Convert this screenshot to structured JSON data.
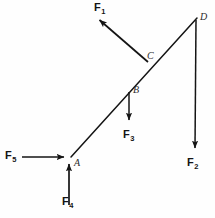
{
  "figure": {
    "type": "free-body-diagram",
    "background_color": "#fefefe",
    "stroke_color": "#141414",
    "points": [
      {
        "id": "A",
        "label": "A",
        "x": 71,
        "y": 157
      },
      {
        "id": "B",
        "label": "B",
        "x": 120,
        "y": 96
      },
      {
        "id": "C",
        "label": "C",
        "x": 148,
        "y": 62
      },
      {
        "id": "D",
        "label": "D",
        "x": 197,
        "y": 18
      }
    ],
    "members": [
      {
        "name": "diagonal-AD",
        "from": "A",
        "to": "D"
      },
      {
        "name": "vertical-D-down",
        "from": "D",
        "to": "F2-tip"
      }
    ],
    "forces": [
      {
        "id": "F1",
        "label": "F",
        "subscript": "1",
        "applied_at": "C",
        "direction": "up-left",
        "tail": {
          "x": 148,
          "y": 62
        },
        "tip": {
          "x": 96,
          "y": 17
        },
        "label_pos": {
          "x": 96,
          "y": 2
        }
      },
      {
        "id": "F2",
        "label": "F",
        "subscript": "2",
        "applied_at": "D",
        "direction": "down",
        "tail": {
          "x": 196,
          "y": 20
        },
        "tip": {
          "x": 195,
          "y": 152
        },
        "label_pos": {
          "x": 188,
          "y": 158
        }
      },
      {
        "id": "F3",
        "label": "F",
        "subscript": "3",
        "applied_at": "B",
        "direction": "down",
        "tail": {
          "x": 120,
          "y": 92
        },
        "tip": {
          "x": 129,
          "y": 124
        },
        "label_pos": {
          "x": 122,
          "y": 130
        }
      },
      {
        "id": "F4",
        "label": "F",
        "subscript": "4",
        "applied_at": "A",
        "direction": "up",
        "tail": {
          "x": 69,
          "y": 205
        },
        "tip": {
          "x": 69,
          "y": 161
        },
        "label_pos": {
          "x": 61,
          "y": 196
        }
      },
      {
        "id": "F5",
        "label": "F",
        "subscript": "5",
        "applied_at": "A",
        "direction": "right",
        "tail": {
          "x": 22,
          "y": 157
        },
        "tip": {
          "x": 67,
          "y": 157
        },
        "label_pos": {
          "x": 5,
          "y": 150
        }
      }
    ]
  }
}
